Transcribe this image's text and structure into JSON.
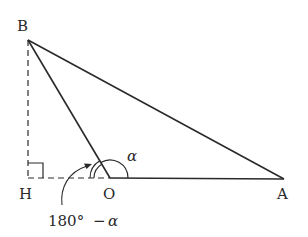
{
  "diagram": {
    "points": {
      "B": {
        "label": "B",
        "x": 28,
        "y": 40
      },
      "H": {
        "label": "H",
        "x": 28,
        "y": 178
      },
      "O": {
        "label": "O",
        "x": 110,
        "y": 178
      },
      "A": {
        "label": "A",
        "x": 284,
        "y": 179
      }
    },
    "angle_label_alpha": "α",
    "angle_label_supplement": "180° − α",
    "supplement_number": "180°",
    "supplement_minus": "−",
    "supplement_alpha": "α",
    "colors": {
      "stroke": "#2a2a2a",
      "background": "#ffffff"
    }
  }
}
